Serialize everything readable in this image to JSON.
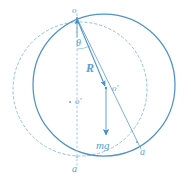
{
  "figure": {
    "colors": {
      "stroke": "#57a0d3",
      "stroke_light": "#8fc2e6",
      "fill_arrow": "#3f8fcc",
      "background": "#ffffff"
    },
    "labels": {
      "top_vertex": "o",
      "angle": "θ",
      "radius_vector": "R",
      "center_right": "o′",
      "center_left": "o′",
      "weight_vector": "mg",
      "contact_bottom": "a",
      "contact_right": "a"
    },
    "geometry": {
      "solid_circle": {
        "cx": 104,
        "cy": 85,
        "r": 71
      },
      "dashed_circle": {
        "cx": 80,
        "cy": 89,
        "r": 67
      },
      "top_point": {
        "x": 77,
        "y": 18
      },
      "center_point": {
        "x": 106,
        "y": 88
      },
      "left_center_point": {
        "x": 70,
        "y": 102
      },
      "bottom_point": {
        "x": 77,
        "y": 157
      },
      "right_contact_point": {
        "x": 137,
        "y": 143
      },
      "mg_arrow_tip": {
        "x": 106,
        "y": 139
      },
      "angle_deg": 22
    }
  }
}
